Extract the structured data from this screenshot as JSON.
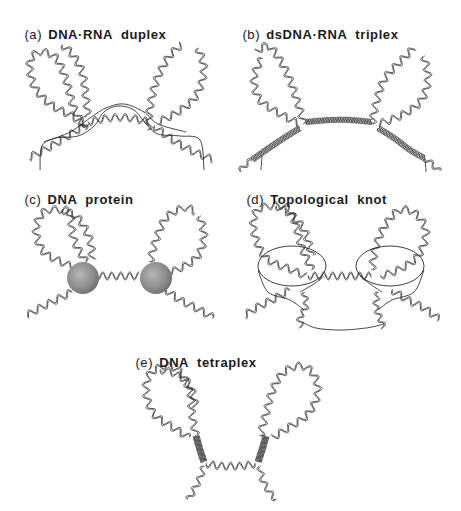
{
  "figure": {
    "panels": [
      {
        "id": "a",
        "tag": "(a)",
        "title": "DNA·RNA  duplex",
        "label_pos": [
          16,
          12
        ]
      },
      {
        "id": "b",
        "tag": "(b)",
        "title": "dsDNA·RNA  triplex",
        "label_pos": [
          234,
          12
        ]
      },
      {
        "id": "c",
        "tag": "(c)",
        "title": "DNA  protein",
        "label_pos": [
          16,
          177
        ]
      },
      {
        "id": "d",
        "tag": "(d)",
        "title": "Topological  knot",
        "label_pos": [
          238,
          177
        ]
      },
      {
        "id": "e",
        "tag": "(e)",
        "title": "DNA  tetraplex",
        "label_pos": [
          127,
          340
        ]
      }
    ],
    "colors": {
      "strand": "#2a2a2a",
      "protein_sphere": "#8f8f8f",
      "background": "#ffffff"
    }
  }
}
